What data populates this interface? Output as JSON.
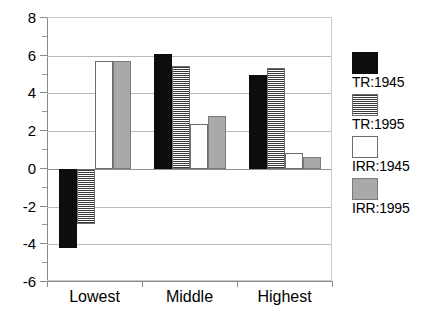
{
  "chart_data": {
    "type": "bar",
    "title": "",
    "subtitle": "",
    "xlabel": "",
    "ylabel": "",
    "categories": [
      "Lowest",
      "Middle",
      "Highest"
    ],
    "ylim": [
      -6,
      8
    ],
    "ytick_step": 2,
    "yticks": [
      8,
      6,
      4,
      2,
      0,
      -2,
      -4,
      -6
    ],
    "ytick_labels": [
      "8",
      "6",
      "4",
      "2",
      "0",
      "-2",
      "-4",
      "-6"
    ],
    "minor_ticks": true,
    "grid": true,
    "grid_axis": "y",
    "legend_position": "right",
    "series": [
      {
        "name": "TR:1945",
        "fill": "solid-black",
        "color": "#0d0d0d",
        "values": [
          -4.2,
          6.1,
          5.0
        ]
      },
      {
        "name": "TR:1995",
        "fill": "horizontal-stripes",
        "color": "#3a3a3a",
        "values": [
          -2.9,
          5.45,
          5.35
        ]
      },
      {
        "name": "IRR:1945",
        "fill": "white",
        "color": "#ffffff",
        "values": [
          5.7,
          2.4,
          0.85
        ]
      },
      {
        "name": "IRR:1995",
        "fill": "solid-gray",
        "color": "#a9a9a9",
        "values": [
          5.7,
          2.8,
          0.65
        ]
      }
    ]
  },
  "legend": {
    "entries": [
      {
        "label": "TR:1945",
        "swatch": "black-swatch"
      },
      {
        "label": "TR:1995",
        "swatch": "stripe-swatch"
      },
      {
        "label": "IRR:1945",
        "swatch": "white-swatch"
      },
      {
        "label": "IRR:1995",
        "swatch": "gray-swatch"
      }
    ]
  }
}
